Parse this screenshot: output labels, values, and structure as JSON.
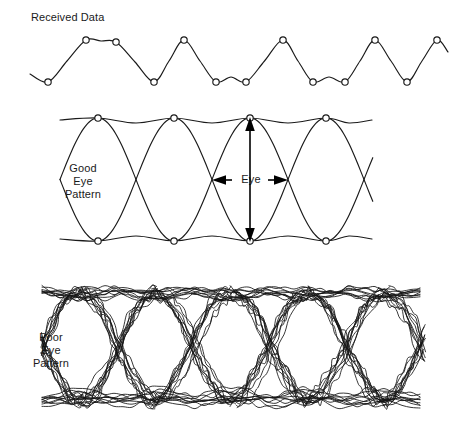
{
  "figure": {
    "title_caption": "",
    "background_color": "#ffffff",
    "stroke_color": "#1a1a1a",
    "width": 459,
    "height": 430
  },
  "panels": [
    {
      "id": "received-data",
      "label": "Received Data",
      "label_lines": [
        "Received Data"
      ],
      "description": "Received data waveform with circular sampling-instant markers"
    },
    {
      "id": "good-eye",
      "label": "Good Eye Pattern",
      "label_lines": [
        "Good",
        "Eye",
        "Pattern"
      ],
      "description": "Clean overlaid eye diagram with wide open eye"
    },
    {
      "id": "poor-eye",
      "label": "Poor Eye Pattern",
      "label_lines": [
        "Poor",
        "Eye",
        "Pattern"
      ],
      "description": "Noisy eye diagram with many jittered overlapping traces closing the eye"
    }
  ],
  "annotations": {
    "eye_dimension_label": "Eye",
    "horizontal_arrow": "double-headed-horizontal-arrow",
    "vertical_arrow": "double-headed-vertical-arrow"
  },
  "chart_data": {
    "type": "line",
    "xlabel": "",
    "ylabel": "",
    "grid": false,
    "legend": "none",
    "panels": [
      {
        "name": "Received Data",
        "type": "line",
        "symbol_interval_px": 38,
        "levels": {
          "high": 40,
          "low": 82
        },
        "bit_sequence": [
          0,
          1,
          1,
          0,
          1,
          0,
          0,
          1,
          0,
          0,
          1,
          1,
          0,
          1
        ],
        "sample_markers_x": [
          48,
          86,
          116,
          154,
          184,
          216,
          246,
          283,
          313,
          345,
          375,
          407,
          437
        ],
        "sample_markers_y": [
          82,
          40,
          42,
          82,
          40,
          82,
          82,
          40,
          82,
          82,
          40,
          82,
          40
        ]
      },
      {
        "name": "Good Eye Pattern",
        "type": "line",
        "unit_interval_px": 76,
        "envelope_top_y": 118,
        "envelope_bottom_y": 241,
        "crossing_y": 180,
        "crossing_x": [
          98,
          174,
          212,
          288,
          364
        ],
        "marker_top_x": [
          98,
          174,
          250,
          326
        ],
        "marker_bottom_x": [
          98,
          174,
          250,
          326
        ],
        "eye_height_px": 123,
        "eye_width_px": 76
      },
      {
        "name": "Poor Eye Pattern",
        "type": "line",
        "unit_interval_px": 76,
        "envelope_top_y": 292,
        "envelope_bottom_y": 400,
        "crossing_y": 347,
        "trace_count": 9,
        "jitter_px": 6,
        "noise_px": 4,
        "eye_closure": "severe"
      }
    ]
  }
}
